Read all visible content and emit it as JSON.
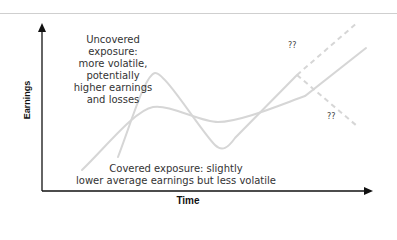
{
  "diagram": {
    "axes": {
      "y_label": "Earnings",
      "x_label": "Time"
    },
    "annotations": {
      "uncovered": "Uncovered exposure: more volatile, potentially higher earnings and losses",
      "uncovered_lines": [
        "Uncovered",
        "exposure:",
        "more volatile,",
        "potentially",
        "higher earnings",
        "and losses"
      ],
      "covered": "Covered exposure: slightly lower average earnings but less volatile",
      "covered_lines": [
        "Covered exposure: slightly",
        "lower average earnings but less volatile"
      ],
      "uncertain_upper": "??",
      "uncertain_lower": "??"
    },
    "series": [
      {
        "name": "Uncovered exposure",
        "style": "solid",
        "color": "#d6d6d6",
        "description": "highly volatile line with large peak and trough"
      },
      {
        "name": "Covered exposure",
        "style": "solid",
        "color": "#d6d6d6",
        "description": "smoother line with smaller swings"
      },
      {
        "name": "Uncovered future (upside)",
        "style": "dashed",
        "color": "#d6d6d6"
      },
      {
        "name": "Uncovered future (downside)",
        "style": "dashed",
        "color": "#d6d6d6"
      }
    ],
    "colors": {
      "axis": "#111111",
      "curve": "#d6d6d6",
      "text": "#333333",
      "top_rule": "#cfcfcf"
    }
  }
}
